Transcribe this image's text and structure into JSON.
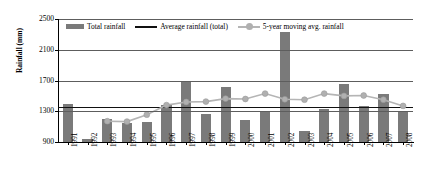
{
  "chart_data": {
    "type": "bar",
    "title": "",
    "xlabel": "",
    "ylabel": "Rainfall (mm)",
    "ylim": [
      900,
      2500
    ],
    "yticks": [
      900,
      1300,
      1700,
      2100,
      2500
    ],
    "grid": true,
    "legend_position": "top-inside",
    "categories": [
      "1991",
      "1992",
      "1993",
      "1994",
      "1995",
      "1996",
      "1997",
      "1998",
      "1999",
      "2000",
      "2001",
      "2002",
      "2003",
      "2004",
      "2005",
      "2006",
      "2007",
      "2008"
    ],
    "series": [
      {
        "name": "Total rainfall",
        "type": "bar",
        "color": "#7a7a7a",
        "values": [
          1400,
          935,
          1205,
          1145,
          1165,
          1375,
          1690,
          1270,
          1610,
          1190,
          1290,
          2335,
          1045,
          1330,
          1660,
          1370,
          1520,
          1290
        ]
      },
      {
        "name": "Average rainfall (total)",
        "type": "line",
        "color": "#111111",
        "value": 1350
      },
      {
        "name": "5-year moving avg. rainfall",
        "type": "line",
        "color": "#b5b5b5",
        "values": [
          null,
          null,
          1170,
          1165,
          1255,
          1380,
          1420,
          1425,
          1465,
          1460,
          1530,
          1455,
          1450,
          1530,
          1500,
          1505,
          1450,
          1370
        ]
      }
    ]
  },
  "legend": {
    "items": [
      {
        "label": "Total rainfall",
        "swatch": "bar-swatch"
      },
      {
        "label": "Average rainfall (total)",
        "swatch": "line-swatch"
      },
      {
        "label": "5-year moving avg. rainfall",
        "swatch": "marker-line-swatch"
      }
    ]
  }
}
